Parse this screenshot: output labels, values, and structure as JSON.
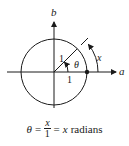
{
  "diagram": {
    "axes": {
      "horizontal_label": "a",
      "vertical_label": "b"
    },
    "circle": {
      "radius_label": "1",
      "base_label": "1"
    },
    "angle_label": "θ",
    "arc_label": "x",
    "colors": {
      "stroke": "#1a1a1a",
      "background": "#ffffff"
    }
  },
  "caption": {
    "theta": "θ",
    "equals1": "=",
    "numerator": "x",
    "denominator": "1",
    "equals2": "=",
    "result_var": "x",
    "result_unit": "radians"
  }
}
